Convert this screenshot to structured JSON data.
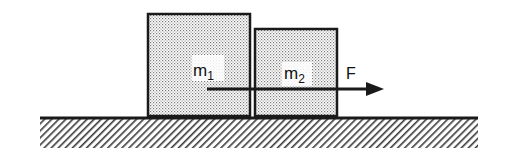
{
  "diagram": {
    "blocks": [
      {
        "id": "block-1",
        "label": "m",
        "subscript": "1"
      },
      {
        "id": "block-2",
        "label": "m",
        "subscript": "2"
      }
    ],
    "force": {
      "label": "F",
      "direction": "right"
    },
    "surface": {
      "type": "hatched-ground"
    },
    "colors": {
      "stroke": "#1a1a1a",
      "fill_dots": "#6e6e6e",
      "background": "#ffffff"
    }
  }
}
